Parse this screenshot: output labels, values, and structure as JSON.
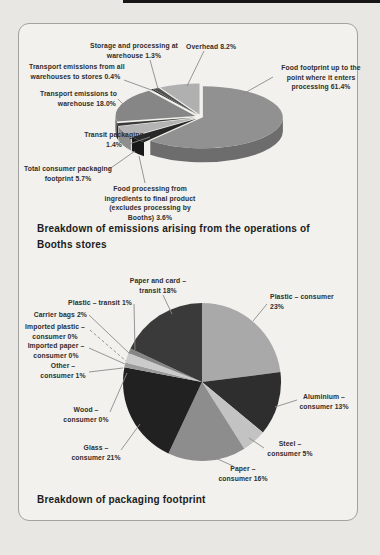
{
  "page": {
    "background_color": "#e8e7e3",
    "panel_background_color": "#f2f1ed",
    "panel_border_color": "#a3a2a0",
    "top_edge_bar_color": "#161616",
    "leader_line_color": "#8b8b8b"
  },
  "chart_data": [
    {
      "type": "pie",
      "variant": "3d-exploded",
      "title": "Breakdown of emissions arising from the operations of Booths stores",
      "title_lines": [
        "Breakdown of emissions arising from the operations of",
        "Booths stores"
      ],
      "unit": "%",
      "legend_position": "callout-labels",
      "categories": [
        "Food footprint up to the point where it enters processing",
        "Food processing from ingredients to final product (excludes processing by Booths)",
        "Total consumer packaging footprint",
        "Transit packaging",
        "Transport emissions to warehouse",
        "Transport emissions from all warehouses to stores",
        "Storage and processing at warehouse",
        "Overhead"
      ],
      "values": [
        61.4,
        3.6,
        5.7,
        1.4,
        18.0,
        0.4,
        1.3,
        8.2
      ],
      "slices": [
        {
          "id": "food_footprint",
          "value": 61.4,
          "color": "#919191",
          "side_color": "#6d6d6d",
          "label": "Food footprint up to the point where it enters processing 61.4%",
          "label_lines": [
            "Food footprint up to the",
            "point where it enters",
            "processing 61.4%"
          ]
        },
        {
          "id": "food_processing",
          "value": 3.6,
          "color": "#282828",
          "side_color": "#181818",
          "label": "Food processing from ingredients to final product (excludes processing by Booths) 3.6%",
          "label_lines": [
            "Food processing from",
            "ingredients to final product",
            "(excludes processing by",
            "Booths) 3.6%"
          ]
        },
        {
          "id": "total_consumer_packaging",
          "value": 5.7,
          "color": "#b4b4b4",
          "side_color": "#8e8e8e",
          "label": "Total consumer packaging footprint 5.7%",
          "label_lines": [
            "Total consumer packaging",
            "footprint 5.7%"
          ]
        },
        {
          "id": "transit_packaging",
          "value": 1.4,
          "color": "#3a3a3a",
          "side_color": "#242424",
          "label": "Transit packaging 1.4%",
          "label_lines": [
            "Transit packaging",
            "1.4%"
          ]
        },
        {
          "id": "transport_to_warehouse",
          "value": 18.0,
          "color": "#868686",
          "side_color": "#636363",
          "label": "Transport emissions to warehouse 18.0%",
          "label_lines": [
            "Transport emissions to",
            "warehouse 18.0%"
          ]
        },
        {
          "id": "transport_warehouses_to_stores",
          "value": 0.4,
          "color": "#1f1f1f",
          "side_color": "#141414",
          "label": "Transport emissions from all warehouses to stores 0.4%",
          "label_lines": [
            "Transport emissions from all",
            "warehouses to stores 0.4%"
          ]
        },
        {
          "id": "storage_processing_warehouse",
          "value": 1.3,
          "color": "#535353",
          "side_color": "#3a3a3a",
          "label": "Storage and processing at warehouse 1.3%",
          "label_lines": [
            "Storage and processing at",
            "warehouse 1.3%"
          ]
        },
        {
          "id": "overhead",
          "value": 8.2,
          "color": "#b0b0b0",
          "side_color": "#8a8a8a",
          "label": "Overhead 8.2%",
          "label_lines": [
            "Overhead 8.2%"
          ]
        }
      ]
    },
    {
      "type": "pie",
      "variant": "flat",
      "title": "Breakdown of packaging footprint",
      "title_lines": [
        "Breakdown of packaging footprint"
      ],
      "unit": "%",
      "legend_position": "callout-labels",
      "categories": [
        "Plastic – consumer",
        "Aluminium – consumer",
        "Steel – consumer",
        "Paper – consumer",
        "Glass – consumer",
        "Wood – consumer",
        "Other – consumer",
        "Imported paper – consumer",
        "Imported plastic – consumer",
        "Carrier bags",
        "Plastic – transit",
        "Paper and card – transit"
      ],
      "values": [
        23,
        13,
        5,
        16,
        21,
        0,
        1,
        0,
        0,
        2,
        1,
        18
      ],
      "slices": [
        {
          "id": "plastic_consumer",
          "value": 23,
          "color": "#a9a9a9",
          "label": "Plastic – consumer 23%",
          "label_lines": [
            "Plastic – consumer",
            "23%"
          ]
        },
        {
          "id": "aluminium_consumer",
          "value": 13,
          "color": "#2e2e2e",
          "label": "Aluminium – consumer 13%",
          "label_lines": [
            "Aluminium –",
            "consumer 13%"
          ]
        },
        {
          "id": "steel_consumer",
          "value": 5,
          "color": "#c3c3c3",
          "label": "Steel – consumer 5%",
          "label_lines": [
            "Steel –",
            "consumer 5%"
          ]
        },
        {
          "id": "paper_consumer",
          "value": 16,
          "color": "#8d8d8d",
          "label": "Paper – consumer 16%",
          "label_lines": [
            "Paper –",
            "consumer 16%"
          ]
        },
        {
          "id": "glass_consumer",
          "value": 21,
          "color": "#212121",
          "label": "Glass – consumer 21%",
          "label_lines": [
            "Glass –",
            "consumer 21%"
          ]
        },
        {
          "id": "wood_consumer",
          "value": 0,
          "color": "#777777",
          "label": "Wood – consumer 0%",
          "label_lines": [
            "Wood –",
            "consumer 0%"
          ]
        },
        {
          "id": "other_consumer",
          "value": 1,
          "color": "#9b9b9b",
          "label": "Other – consumer 1%",
          "label_lines": [
            "Other –",
            "consumer 1%"
          ]
        },
        {
          "id": "imported_paper_consumer",
          "value": 0,
          "color": "#777777",
          "label": "Imported paper – consumer 0%",
          "label_lines": [
            "Imported paper –",
            "consumer 0%"
          ]
        },
        {
          "id": "imported_plastic_consumer",
          "value": 0,
          "color": "#777777",
          "label": "Imported plastic – consumer 0%",
          "label_lines": [
            "Imported plastic –",
            "consumer 0%"
          ]
        },
        {
          "id": "carrier_bags",
          "value": 2,
          "color": "#cbcbcb",
          "label": "Carrier bags 2%",
          "label_lines": [
            "Carrier bags 2%"
          ]
        },
        {
          "id": "plastic_transit",
          "value": 1,
          "color": "#858585",
          "label": "Plastic – transit 1%",
          "label_lines": [
            "Plastic – transit 1%"
          ]
        },
        {
          "id": "paper_card_transit",
          "value": 18,
          "color": "#3a3a3a",
          "label": "Paper and card – transit 18%",
          "label_lines": [
            "Paper and card –",
            "transit 18%"
          ]
        }
      ]
    }
  ]
}
